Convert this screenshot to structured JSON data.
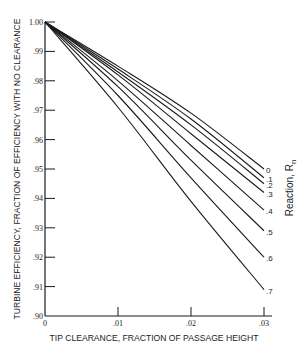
{
  "chart_data": {
    "type": "line",
    "title": "",
    "xlabel": "TIP CLEARANCE, FRACTION OF PASSAGE HEIGHT",
    "ylabel": "TURBINE EFFICIENCY, FRACTION OF EFFICIENCY WITH NO CLEARANCE",
    "xlim": [
      0,
      0.03
    ],
    "ylim": [
      0.9,
      1.0
    ],
    "x_ticks": [
      "0",
      ".01",
      ".02",
      ".03"
    ],
    "y_ticks": [
      ".90",
      ".91",
      ".92",
      ".93",
      ".94",
      ".95",
      ".96",
      ".97",
      ".98",
      ".99",
      "1.00"
    ],
    "grid": false,
    "legend": {
      "title": "Reaction, R",
      "title_subscript": "n",
      "position": "right, labels at curve ends"
    },
    "x": [
      0,
      0.01,
      0.02,
      0.03
    ],
    "series": [
      {
        "name": "0",
        "values": [
          1.0,
          0.985,
          0.969,
          0.95
        ]
      },
      {
        "name": ".1",
        "values": [
          1.0,
          0.984,
          0.967,
          0.947
        ]
      },
      {
        "name": ".2",
        "values": [
          1.0,
          0.983,
          0.965,
          0.945
        ]
      },
      {
        "name": ".3",
        "values": [
          1.0,
          0.982,
          0.962,
          0.942
        ]
      },
      {
        "name": ".4",
        "values": [
          1.0,
          0.98,
          0.958,
          0.936
        ]
      },
      {
        "name": ".5",
        "values": [
          1.0,
          0.978,
          0.953,
          0.929
        ]
      },
      {
        "name": ".6",
        "values": [
          1.0,
          0.975,
          0.947,
          0.92
        ]
      },
      {
        "name": ".7",
        "values": [
          1.0,
          0.971,
          0.939,
          0.909
        ]
      }
    ]
  },
  "colors": {
    "line": "#1a1a1a",
    "axis": "#1a1a1a",
    "background": "#ffffff"
  }
}
